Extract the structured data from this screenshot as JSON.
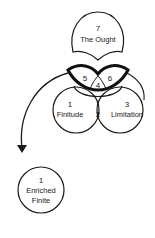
{
  "diagram": {
    "nodes": [
      {
        "id": "ought",
        "number": "7",
        "label": "The Ought"
      },
      {
        "id": "finitude",
        "number": "1",
        "label": "Finitude"
      },
      {
        "id": "overlap",
        "number": "2",
        "label": ""
      },
      {
        "id": "limitation",
        "number": "3",
        "label": "Limitation"
      },
      {
        "id": "lens-center",
        "number": "4",
        "label": ""
      },
      {
        "id": "lens-left",
        "number": "5",
        "label": ""
      },
      {
        "id": "lens-right",
        "number": "6",
        "label": ""
      },
      {
        "id": "enriched",
        "number": "1",
        "label_line1": "Enriched",
        "label_line2": "Finite"
      }
    ],
    "colors": {
      "stroke": "#1a1a1a",
      "background": "#ffffff"
    }
  }
}
